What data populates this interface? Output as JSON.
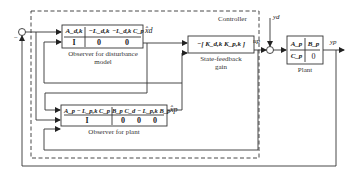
{
  "diagram": {
    "controller_label": "Controller",
    "blocks": {
      "disturbance_observer": {
        "caption_line1": "Observer for disturbance",
        "caption_line2": "model",
        "row1": [
          "A_d,k",
          "−L_d,k",
          "−L_d,k C_p"
        ],
        "row2": [
          "I",
          "0",
          "0"
        ]
      },
      "state_feedback": {
        "caption_line1": "State-feedback",
        "caption_line2": "gain",
        "content": "−[ K_d,k   K_p,k ]"
      },
      "plant_observer": {
        "caption": "Observer for plant",
        "row1": [
          "A_p − L_p,k C_p",
          "B_p C_d − L_p,k B_p"
        ],
        "row2": [
          "I",
          "0",
          "0",
          "0"
        ]
      },
      "plant": {
        "caption": "Plant",
        "row1": [
          "A_p",
          "B_p"
        ],
        "row2": [
          "C_p",
          "0"
        ]
      }
    },
    "signals": {
      "xd_hat": "x̂d",
      "xp_hat": "x̂p",
      "u_p": "up",
      "y_d": "yd",
      "y_p": "yp"
    },
    "sum_junction_sign": "−"
  }
}
